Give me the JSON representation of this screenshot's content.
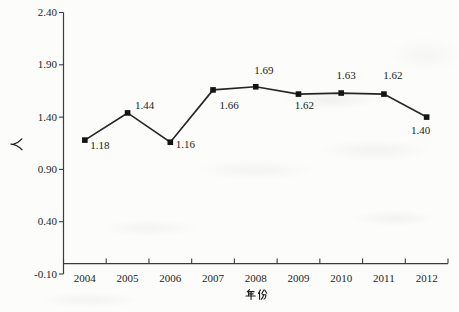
{
  "figure": {
    "background": "#fcfcfb",
    "axis_color": "#3c3c3c",
    "text_color": "#1c1c1c"
  },
  "chart_data": {
    "type": "line",
    "title": "",
    "xlabel": "年份",
    "ylabel": "人",
    "categories": [
      "2004",
      "2005",
      "2006",
      "2007",
      "2008",
      "2009",
      "2010",
      "2011",
      "2012"
    ],
    "values": [
      1.18,
      1.44,
      1.16,
      1.66,
      1.69,
      1.62,
      1.63,
      1.62,
      1.4
    ],
    "point_labels": [
      "1.18",
      "1.44",
      "1.16",
      "1.66",
      "1.69",
      "1.62",
      "1.63",
      "1.62",
      "1.40"
    ],
    "label_offsets": [
      [
        15,
        9
      ],
      [
        17,
        -4
      ],
      [
        15,
        6
      ],
      [
        16,
        19
      ],
      [
        8,
        -13
      ],
      [
        6,
        15
      ],
      [
        5,
        -14
      ],
      [
        9,
        -15
      ],
      [
        -6,
        17
      ]
    ],
    "ylim": [
      -0.1,
      2.4
    ],
    "yticks": [
      {
        "value": 2.4,
        "label": "2.40"
      },
      {
        "value": 1.9,
        "label": "1.90"
      },
      {
        "value": 1.4,
        "label": "1.40"
      },
      {
        "value": 0.9,
        "label": "0.90"
      },
      {
        "value": 0.4,
        "label": "0.40"
      },
      {
        "value": -0.1,
        "label": "-0.10"
      }
    ],
    "x_axis_cross_value": 0,
    "grid": false,
    "legend": null,
    "line_color": "#262626",
    "marker": "square",
    "marker_color": "#141414"
  }
}
